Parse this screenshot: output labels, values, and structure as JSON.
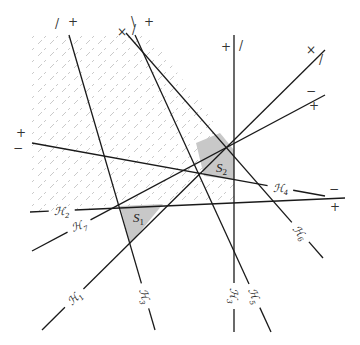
{
  "diagram": {
    "colors": {
      "line": "#1a1a1a",
      "shaded_region": "#c8c8c8",
      "hatch": "#bdbdbd",
      "background": "#ffffff"
    },
    "hyperplanes": [
      {
        "id": "H1",
        "label_main": "ℋ",
        "label_sub": "1",
        "x1": 42,
        "y1": 330,
        "x2": 325,
        "y2": 50,
        "label_x": 76,
        "label_y": 300,
        "label_angle": -45
      },
      {
        "id": "H2",
        "label_main": "ℋ",
        "label_sub": "2",
        "x1": 30,
        "y1": 212,
        "x2": 345,
        "y2": 198,
        "label_x": 62,
        "label_y": 216,
        "label_angle": 0
      },
      {
        "id": "H3",
        "label_main": "ℋ",
        "label_sub": "3",
        "x1": 69,
        "y1": 35,
        "x2": 155,
        "y2": 330,
        "label_x": 148,
        "label_y": 295,
        "label_angle": 74
      },
      {
        "id": "H4",
        "label_main": "ℋ",
        "label_sub": "4",
        "x1": 32,
        "y1": 143,
        "x2": 325,
        "y2": 196,
        "label_x": 280,
        "label_y": 190,
        "label_angle": 0
      },
      {
        "id": "H5",
        "label_main": "ℋ",
        "label_sub": "5",
        "x1": 135,
        "y1": 35,
        "x2": 271,
        "y2": 332,
        "label_x": 254,
        "label_y": 296,
        "label_angle": 68
      },
      {
        "id": "H6",
        "label_main": "ℋ",
        "label_sub": "6",
        "x1": 126,
        "y1": 33,
        "x2": 323,
        "y2": 258,
        "label_x": 296,
        "label_y": 236,
        "label_angle": 52
      },
      {
        "id": "H7v",
        "label_main": "ℋ",
        "label_sub": "3",
        "x1": 234,
        "y1": 35,
        "x2": 234,
        "y2": 332,
        "label_x": 234,
        "label_y": 296,
        "label_angle": 90
      },
      {
        "id": "H7",
        "label_main": "ℋ",
        "label_sub": "7",
        "x1": 32,
        "y1": 251,
        "x2": 325,
        "y2": 95,
        "label_x": 62,
        "label_y": 194,
        "label_angle": -20
      }
    ],
    "signs": [
      {
        "text": "/",
        "x": 57,
        "y": 28
      },
      {
        "text": "+",
        "x": 73,
        "y": 26
      },
      {
        "text": "×",
        "x": 122,
        "y": 36
      },
      {
        "text": "\\",
        "x": 133,
        "y": 26
      },
      {
        "text": "/",
        "x": 134,
        "y": 34
      },
      {
        "text": "+",
        "x": 149,
        "y": 26
      },
      {
        "text": "+",
        "x": 226,
        "y": 51
      },
      {
        "text": "/",
        "x": 241,
        "y": 50
      },
      {
        "text": "×",
        "x": 311,
        "y": 54
      },
      {
        "text": "/",
        "x": 321,
        "y": 64
      },
      {
        "text": "−",
        "x": 311,
        "y": 95
      },
      {
        "text": "+",
        "x": 314,
        "y": 110
      },
      {
        "text": "+",
        "x": 21,
        "y": 137
      },
      {
        "text": "−",
        "x": 18,
        "y": 152
      },
      {
        "text": "−",
        "x": 334,
        "y": 193
      },
      {
        "text": "+",
        "x": 335,
        "y": 211
      }
    ],
    "cells": [
      {
        "id": "S1",
        "label_main": "S",
        "label_sub": "1",
        "x": 133,
        "y": 222,
        "polygon": "120,206 163,204 130,244"
      },
      {
        "id": "S2",
        "label_main": "S",
        "label_sub": "2",
        "x": 216,
        "y": 172,
        "polygon": "196,143 220,133 234,150 234,180 204,176"
      }
    ],
    "hatched_region": {
      "polygon": "30,35 150,35 234,150 234,200 30,212",
      "description": "half-space intersection shaded with dashed hatching"
    }
  }
}
